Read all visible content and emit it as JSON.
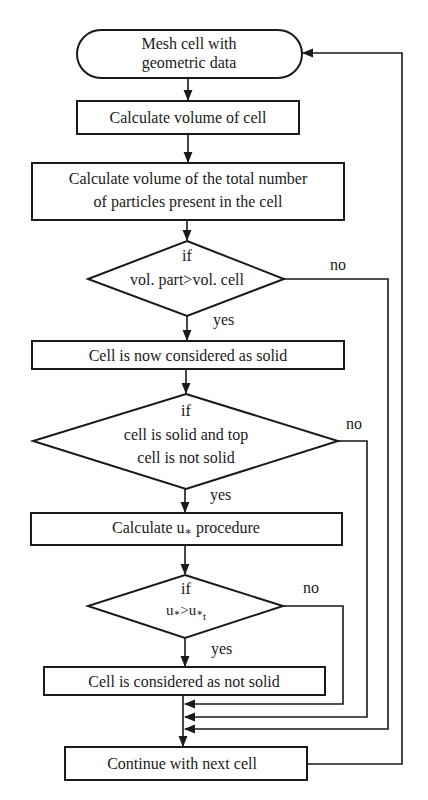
{
  "diagram": {
    "type": "flowchart",
    "nodes": {
      "start": {
        "kind": "terminator",
        "lines": [
          "Mesh cell with",
          "geometric data"
        ]
      },
      "calc_cell_volume": {
        "kind": "process",
        "label": "Calculate volume of cell"
      },
      "calc_particle_volume": {
        "kind": "process",
        "lines": [
          "Calculate volume of the total number",
          "of particles present in the cell"
        ]
      },
      "decision_volume": {
        "kind": "decision",
        "if_label": "if",
        "condition": "vol. part>vol. cell"
      },
      "cell_solid": {
        "kind": "process",
        "label": "Cell is now considered as solid"
      },
      "decision_top": {
        "kind": "decision",
        "if_label": "if",
        "lines": [
          "cell is solid and top",
          "cell is not solid"
        ]
      },
      "calc_ustar": {
        "kind": "process",
        "prefix": "Calculate u",
        "star": "∗",
        "suffix": " procedure"
      },
      "decision_ustar": {
        "kind": "decision",
        "if_label": "if",
        "lhs": "u",
        "lhs_star": "∗",
        "op": ">",
        "rhs": "u",
        "rhs_star": "∗",
        "rhs_sub": "t"
      },
      "cell_not_solid": {
        "kind": "process",
        "label": "Cell is considered as not solid"
      },
      "continue": {
        "kind": "process",
        "label": "Continue with next cell"
      }
    },
    "edge_labels": {
      "yes": "yes",
      "no": "no"
    },
    "edges": [
      {
        "from": "start",
        "to": "calc_cell_volume"
      },
      {
        "from": "calc_cell_volume",
        "to": "calc_particle_volume"
      },
      {
        "from": "calc_particle_volume",
        "to": "decision_volume"
      },
      {
        "from": "decision_volume",
        "to": "cell_solid",
        "label": "yes"
      },
      {
        "from": "decision_volume",
        "to": "continue",
        "label": "no"
      },
      {
        "from": "cell_solid",
        "to": "decision_top"
      },
      {
        "from": "decision_top",
        "to": "calc_ustar",
        "label": "yes"
      },
      {
        "from": "decision_top",
        "to": "continue",
        "label": "no"
      },
      {
        "from": "calc_ustar",
        "to": "decision_ustar"
      },
      {
        "from": "decision_ustar",
        "to": "cell_not_solid",
        "label": "yes"
      },
      {
        "from": "decision_ustar",
        "to": "continue",
        "label": "no"
      },
      {
        "from": "cell_not_solid",
        "to": "continue"
      },
      {
        "from": "continue",
        "to": "start",
        "label": "loop"
      }
    ],
    "colors": {
      "stroke": "#1a1a1a",
      "fill": "#ffffff",
      "background": "#ffffff"
    }
  }
}
